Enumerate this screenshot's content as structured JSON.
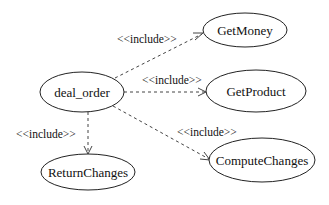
{
  "diagram": {
    "type": "uml-use-case",
    "use_cases": [
      {
        "id": "deal_order",
        "label": "deal_order",
        "cx": 82,
        "cy": 92,
        "rx": 42,
        "ry": 20
      },
      {
        "id": "GetMoney",
        "label": "GetMoney",
        "cx": 245,
        "cy": 30,
        "rx": 42,
        "ry": 17
      },
      {
        "id": "GetProduct",
        "label": "GetProduct",
        "cx": 256,
        "cy": 91,
        "rx": 50,
        "ry": 21
      },
      {
        "id": "ComputeChanges",
        "label": "ComputeChanges",
        "cx": 262,
        "cy": 160,
        "rx": 53,
        "ry": 22
      },
      {
        "id": "ReturnChanges",
        "label": "ReturnChanges",
        "cx": 88,
        "cy": 172,
        "rx": 47,
        "ry": 18
      }
    ],
    "relations": [
      {
        "from": "deal_order",
        "to": "GetMoney",
        "stereotype": "<<include>>"
      },
      {
        "from": "deal_order",
        "to": "GetProduct",
        "stereotype": "<<include>>"
      },
      {
        "from": "deal_order",
        "to": "ComputeChanges",
        "stereotype": "<<include>>"
      },
      {
        "from": "deal_order",
        "to": "ReturnChanges",
        "stereotype": "<<include>>"
      }
    ]
  }
}
